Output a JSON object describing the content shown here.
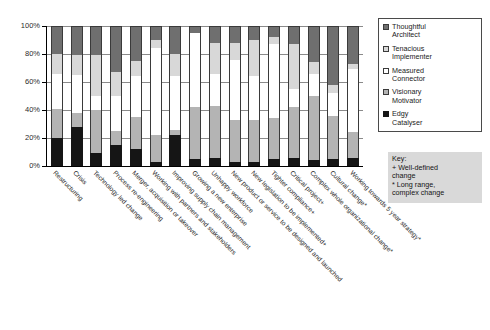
{
  "chart": {
    "type": "bar",
    "title": "",
    "xlabel": "",
    "ylabel": ""
  },
  "yaxis": {
    "ticks": [
      "100%",
      "80%",
      "60%",
      "40%",
      "20%",
      "0%"
    ],
    "min": 0,
    "max": 100
  },
  "legend": {
    "position": "right-top",
    "items": [
      {
        "label": "Thoughtful Architect",
        "line1": "Thoughtful",
        "line2": "Architect",
        "color": "#6f6f6f",
        "key": "thoughtful"
      },
      {
        "label": "Tenacious Implementer",
        "line1": "Tenacious",
        "line2": "Implementer",
        "color": "#d8d8d8",
        "key": "tenacious"
      },
      {
        "label": "Measured Connector",
        "line1": "Measured",
        "line2": "Connector",
        "color": "#ffffff",
        "key": "measured"
      },
      {
        "label": "Visionary Motivator",
        "line1": "Visionary",
        "line2": "Motivator",
        "color": "#b4b4b4",
        "key": "visionary"
      },
      {
        "label": "Edgy Catalyser",
        "line1": "Edgy",
        "line2": "Catalyser",
        "color": "#151515",
        "key": "edgy"
      }
    ]
  },
  "keybox": {
    "title": "Key:",
    "line1": "+ Well-defined",
    "line2": "change",
    "line3": "* Long range,",
    "line4": "complex change"
  },
  "chart_data": {
    "type": "bar",
    "stacked": true,
    "stack_total": 100,
    "title": "",
    "xlabel": "",
    "ylabel": "",
    "ylim": [
      0,
      100
    ],
    "ytick_labels": [
      "0%",
      "20%",
      "40%",
      "60%",
      "80%",
      "100%"
    ],
    "grid": true,
    "legend_position": "right-top",
    "categories": [
      "Restructuring",
      "Crisis",
      "Technology led change",
      "Process re-engineering",
      "Merger, acquisition or takeover",
      "Working with partners and stakeholders",
      "Improving supply chain management",
      "Growing a new enterprise",
      "Unhappy workforce",
      "New product or service to be designed and launched",
      "New legislation to be implemented+",
      "Tighter compliance+",
      "Critical project+",
      "Complex whole organizational change*",
      "Cultural change*",
      "Working towards 5 year strategy*"
    ],
    "series": [
      {
        "name": "Edgy Catalyser",
        "color": "#151515",
        "values": [
          20,
          28,
          9,
          15,
          12,
          3,
          22,
          5,
          6,
          3,
          3,
          5,
          6,
          4,
          5,
          6
        ]
      },
      {
        "name": "Visionary Motivator",
        "color": "#b4b4b4",
        "values": [
          21,
          10,
          31,
          10,
          23,
          19,
          4,
          37,
          37,
          30,
          30,
          29,
          36,
          46,
          31,
          18
        ]
      },
      {
        "name": "Measured Connector",
        "color": "#ffffff",
        "values": [
          25,
          27,
          10,
          25,
          29,
          62,
          38,
          53,
          23,
          43,
          31,
          53,
          13,
          16,
          16,
          45
        ]
      },
      {
        "name": "Tenacious Implementer",
        "color": "#d8d8d8",
        "values": [
          14,
          14,
          29,
          17,
          11,
          6,
          16,
          0,
          22,
          12,
          26,
          5,
          32,
          8,
          6,
          4
        ]
      },
      {
        "name": "Thoughtful Architect",
        "color": "#6f6f6f",
        "values": [
          20,
          21,
          21,
          33,
          25,
          10,
          20,
          5,
          12,
          12,
          10,
          8,
          13,
          26,
          42,
          27
        ]
      }
    ],
    "notes": [
      "+ Well-defined change",
      "* Long range, complex change"
    ]
  }
}
